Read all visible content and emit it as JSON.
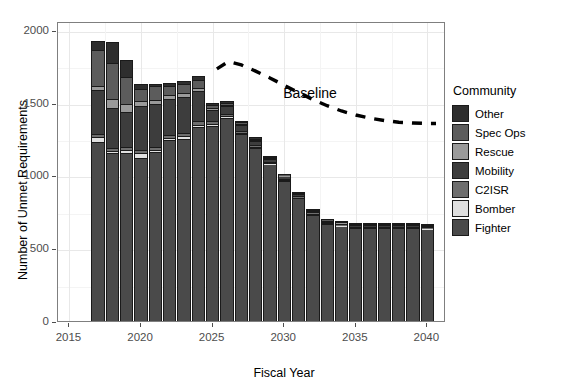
{
  "chart_data": {
    "type": "bar",
    "bar_mode": "stacked",
    "title": "",
    "xlabel": "Fiscal Year",
    "ylabel": "Number of Unmet Requirements",
    "xlim": [
      2014.2,
      2041.3
    ],
    "ylim": [
      0,
      2060
    ],
    "xticks": [
      2015,
      2020,
      2025,
      2030,
      2035,
      2040
    ],
    "yticks": [
      0,
      500,
      1000,
      1500,
      2000
    ],
    "grid": true,
    "legend": {
      "title": "Community",
      "position": "right",
      "entries": [
        {
          "label": "Other",
          "color": "#2e2e2e"
        },
        {
          "label": "Spec Ops",
          "color": "#5c5c5c"
        },
        {
          "label": "Rescue",
          "color": "#9a9a9a"
        },
        {
          "label": "Mobility",
          "color": "#3d3d3d"
        },
        {
          "label": "C2ISR",
          "color": "#6e6e6e"
        },
        {
          "label": "Bomber",
          "color": "#e0e0e0"
        },
        {
          "label": "Fighter",
          "color": "#4a4a4a"
        }
      ]
    },
    "categories": [
      2017,
      2018,
      2019,
      2020,
      2021,
      2022,
      2023,
      2024,
      2025,
      2026,
      2027,
      2028,
      2029,
      2030,
      2031,
      2032,
      2033,
      2034,
      2035,
      2036,
      2037,
      2038,
      2039,
      2040
    ],
    "series": [
      {
        "name": "Fighter",
        "values": [
          1240,
          1165,
          1170,
          1135,
          1175,
          1255,
          1265,
          1345,
          1350,
          1410,
          1295,
          1200,
          1090,
          975,
          855,
          745,
          680,
          665,
          650,
          650,
          650,
          650,
          650,
          645
        ]
      },
      {
        "name": "Bomber",
        "values": [
          40,
          18,
          16,
          30,
          14,
          12,
          18,
          16,
          14,
          10,
          8,
          8,
          6,
          6,
          6,
          6,
          5,
          5,
          5,
          5,
          5,
          5,
          5,
          5
        ]
      },
      {
        "name": "C2ISR",
        "values": [
          20,
          20,
          20,
          22,
          20,
          22,
          22,
          24,
          20,
          18,
          14,
          12,
          10,
          9,
          8,
          8,
          7,
          7,
          7,
          7,
          7,
          7,
          7,
          7
        ]
      },
      {
        "name": "Mobility",
        "values": [
          300,
          275,
          240,
          300,
          295,
          250,
          250,
          205,
          80,
          50,
          40,
          30,
          22,
          18,
          15,
          12,
          10,
          10,
          10,
          10,
          10,
          10,
          10,
          10
        ]
      },
      {
        "name": "Rescue",
        "values": [
          28,
          60,
          55,
          35,
          30,
          26,
          24,
          24,
          12,
          8,
          8,
          6,
          5,
          5,
          4,
          4,
          4,
          4,
          4,
          4,
          4,
          4,
          4,
          4
        ]
      },
      {
        "name": "Spec Ops",
        "values": [
          250,
          250,
          185,
          85,
          90,
          60,
          60,
          55,
          22,
          16,
          14,
          10,
          8,
          7,
          6,
          6,
          5,
          5,
          5,
          5,
          5,
          5,
          5,
          5
        ]
      },
      {
        "name": "Other",
        "values": [
          60,
          140,
          120,
          35,
          20,
          20,
          20,
          30,
          15,
          12,
          10,
          8,
          6,
          5,
          5,
          5,
          4,
          4,
          4,
          4,
          4,
          4,
          4,
          4
        ]
      }
    ],
    "totals": [
      1938,
      1928,
      1806,
      1642,
      1644,
      1645,
      1659,
      1699,
      1513,
      1524,
      1389,
      1274,
      1147,
      1025,
      899,
      786,
      715,
      700,
      685,
      685,
      685,
      685,
      685,
      680
    ],
    "annotations": [
      {
        "text": "Baseline",
        "x": 2032.3,
        "y": 1565
      }
    ],
    "reference_line": {
      "label": "Baseline",
      "style": "dashed",
      "color": "#000000",
      "x": [
        2025.3,
        2026.1,
        2027,
        2028,
        2029,
        2030,
        2031,
        2032,
        2033,
        2034,
        2035,
        2036,
        2037,
        2038,
        2039,
        2040,
        2040.6
      ],
      "y": [
        1745,
        1795,
        1772,
        1730,
        1683,
        1632,
        1583,
        1535,
        1492,
        1456,
        1428,
        1406,
        1390,
        1379,
        1373,
        1370,
        1370
      ]
    }
  }
}
